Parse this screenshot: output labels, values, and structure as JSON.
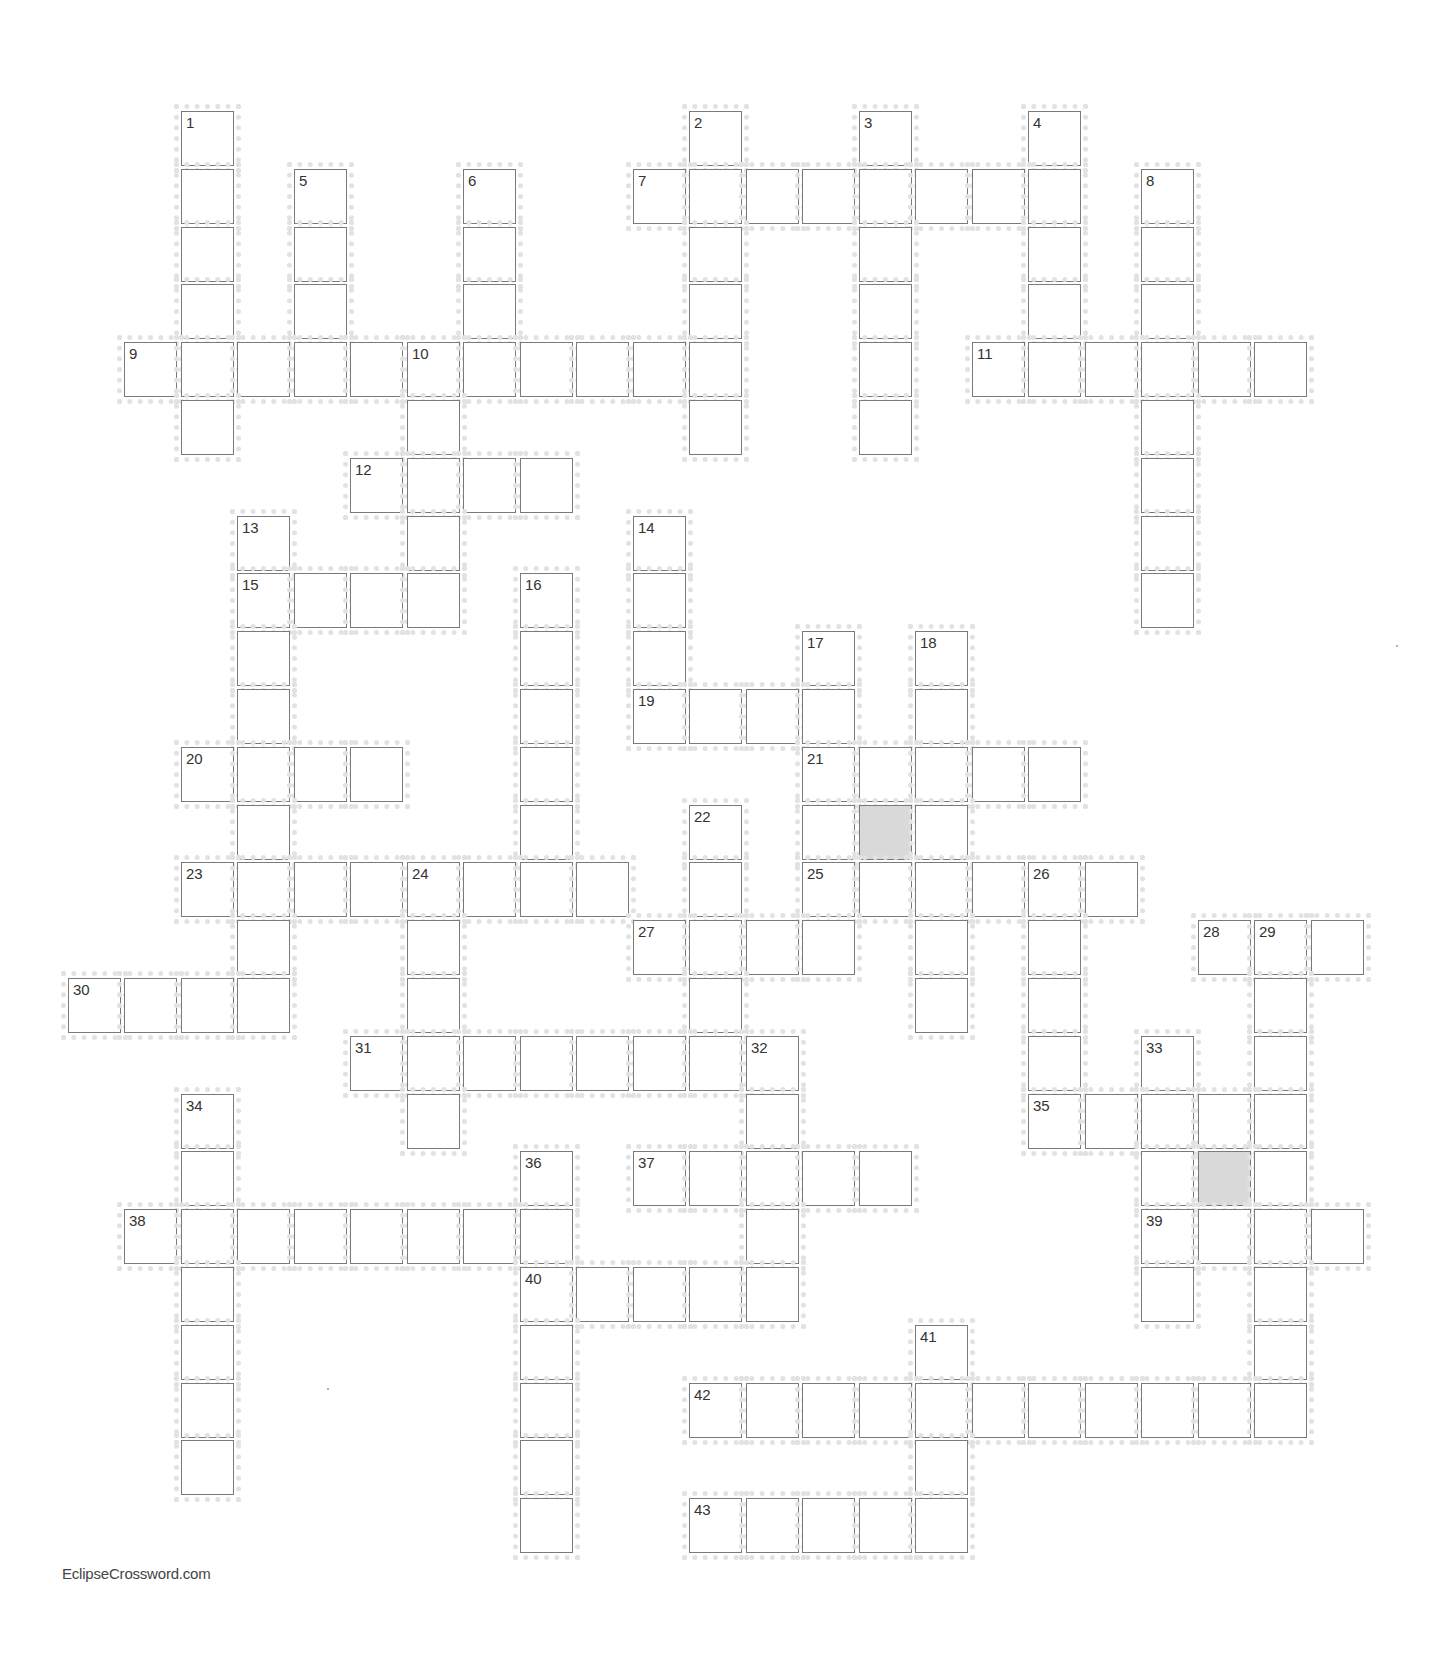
{
  "puzzle": {
    "type": "crossword",
    "grid": {
      "cols": 23,
      "rows": 25
    },
    "layout": {
      "origin_x": 67.5,
      "origin_y": 111,
      "pitch_x": 56.5,
      "pitch_y": 57.8
    },
    "colors": {
      "cell_border": "#7a7a7a",
      "shaded_cell": "#d9d9d9",
      "number_text": "#333333"
    },
    "rows": [
      {
        "r": 0,
        "cells": [
          [
            2,
            "1"
          ],
          [
            11,
            "2"
          ],
          [
            14,
            "3"
          ],
          [
            17,
            "4"
          ]
        ]
      },
      {
        "r": 1,
        "cells": [
          [
            2,
            ""
          ],
          [
            4,
            "5"
          ],
          [
            7,
            "6"
          ],
          [
            10,
            "7"
          ],
          [
            11,
            ""
          ],
          [
            12,
            ""
          ],
          [
            13,
            ""
          ],
          [
            14,
            ""
          ],
          [
            15,
            ""
          ],
          [
            16,
            ""
          ],
          [
            17,
            ""
          ],
          [
            19,
            "8"
          ]
        ]
      },
      {
        "r": 2,
        "cells": [
          [
            2,
            ""
          ],
          [
            4,
            ""
          ],
          [
            7,
            ""
          ],
          [
            11,
            ""
          ],
          [
            14,
            ""
          ],
          [
            17,
            ""
          ],
          [
            19,
            ""
          ]
        ]
      },
      {
        "r": 3,
        "cells": [
          [
            2,
            ""
          ],
          [
            4,
            ""
          ],
          [
            7,
            ""
          ],
          [
            11,
            ""
          ],
          [
            14,
            ""
          ],
          [
            17,
            ""
          ],
          [
            19,
            ""
          ]
        ]
      },
      {
        "r": 4,
        "cells": [
          [
            1,
            "9"
          ],
          [
            2,
            ""
          ],
          [
            3,
            ""
          ],
          [
            4,
            ""
          ],
          [
            5,
            ""
          ],
          [
            6,
            "10"
          ],
          [
            7,
            ""
          ],
          [
            8,
            ""
          ],
          [
            9,
            ""
          ],
          [
            10,
            ""
          ],
          [
            11,
            ""
          ],
          [
            14,
            ""
          ],
          [
            16,
            "11"
          ],
          [
            17,
            ""
          ],
          [
            18,
            ""
          ],
          [
            19,
            ""
          ],
          [
            20,
            ""
          ],
          [
            21,
            ""
          ]
        ]
      },
      {
        "r": 5,
        "cells": [
          [
            2,
            ""
          ],
          [
            6,
            ""
          ],
          [
            11,
            ""
          ],
          [
            14,
            ""
          ],
          [
            19,
            ""
          ]
        ]
      },
      {
        "r": 6,
        "cells": [
          [
            5,
            "12"
          ],
          [
            6,
            ""
          ],
          [
            7,
            ""
          ],
          [
            8,
            ""
          ],
          [
            19,
            ""
          ]
        ]
      },
      {
        "r": 7,
        "cells": [
          [
            3,
            "13"
          ],
          [
            6,
            ""
          ],
          [
            10,
            "14"
          ],
          [
            19,
            ""
          ]
        ]
      },
      {
        "r": 8,
        "cells": [
          [
            3,
            "15"
          ],
          [
            4,
            ""
          ],
          [
            5,
            ""
          ],
          [
            6,
            ""
          ],
          [
            8,
            "16"
          ],
          [
            10,
            ""
          ],
          [
            19,
            ""
          ]
        ]
      },
      {
        "r": 9,
        "cells": [
          [
            3,
            ""
          ],
          [
            8,
            ""
          ],
          [
            10,
            ""
          ],
          [
            13,
            "17"
          ],
          [
            15,
            "18"
          ]
        ]
      },
      {
        "r": 10,
        "cells": [
          [
            3,
            ""
          ],
          [
            8,
            ""
          ],
          [
            10,
            "19"
          ],
          [
            11,
            ""
          ],
          [
            12,
            ""
          ],
          [
            13,
            ""
          ],
          [
            15,
            ""
          ]
        ]
      },
      {
        "r": 11,
        "cells": [
          [
            2,
            "20"
          ],
          [
            3,
            ""
          ],
          [
            4,
            ""
          ],
          [
            5,
            ""
          ],
          [
            8,
            ""
          ],
          [
            13,
            "21"
          ],
          [
            14,
            ""
          ],
          [
            15,
            ""
          ],
          [
            16,
            ""
          ],
          [
            17,
            ""
          ]
        ]
      },
      {
        "r": 12,
        "cells": [
          [
            3,
            ""
          ],
          [
            8,
            ""
          ],
          [
            11,
            "22"
          ],
          [
            13,
            ""
          ],
          [
            14,
            "#"
          ],
          [
            15,
            ""
          ]
        ]
      },
      {
        "r": 13,
        "cells": [
          [
            2,
            "23"
          ],
          [
            3,
            ""
          ],
          [
            4,
            ""
          ],
          [
            5,
            ""
          ],
          [
            6,
            "24"
          ],
          [
            7,
            ""
          ],
          [
            8,
            ""
          ],
          [
            9,
            ""
          ],
          [
            11,
            ""
          ],
          [
            13,
            "25"
          ],
          [
            14,
            ""
          ],
          [
            15,
            ""
          ],
          [
            16,
            ""
          ],
          [
            17,
            "26"
          ],
          [
            18,
            ""
          ]
        ]
      },
      {
        "r": 14,
        "cells": [
          [
            3,
            ""
          ],
          [
            6,
            ""
          ],
          [
            10,
            "27"
          ],
          [
            11,
            ""
          ],
          [
            12,
            ""
          ],
          [
            13,
            ""
          ],
          [
            15,
            ""
          ],
          [
            17,
            ""
          ],
          [
            20,
            "28"
          ],
          [
            21,
            "29"
          ],
          [
            22,
            ""
          ]
        ]
      },
      {
        "r": 15,
        "cells": [
          [
            0,
            "30"
          ],
          [
            1,
            ""
          ],
          [
            2,
            ""
          ],
          [
            3,
            ""
          ],
          [
            6,
            ""
          ],
          [
            11,
            ""
          ],
          [
            15,
            ""
          ],
          [
            17,
            ""
          ],
          [
            21,
            ""
          ]
        ]
      },
      {
        "r": 16,
        "cells": [
          [
            5,
            "31"
          ],
          [
            6,
            ""
          ],
          [
            7,
            ""
          ],
          [
            8,
            ""
          ],
          [
            9,
            ""
          ],
          [
            10,
            ""
          ],
          [
            11,
            ""
          ],
          [
            12,
            "32"
          ],
          [
            17,
            ""
          ],
          [
            19,
            "33"
          ],
          [
            21,
            ""
          ]
        ]
      },
      {
        "r": 17,
        "cells": [
          [
            2,
            "34"
          ],
          [
            6,
            ""
          ],
          [
            12,
            ""
          ],
          [
            17,
            "35"
          ],
          [
            18,
            ""
          ],
          [
            19,
            ""
          ],
          [
            20,
            ""
          ],
          [
            21,
            ""
          ]
        ]
      },
      {
        "r": 18,
        "cells": [
          [
            2,
            ""
          ],
          [
            8,
            "36"
          ],
          [
            10,
            "37"
          ],
          [
            11,
            ""
          ],
          [
            12,
            ""
          ],
          [
            13,
            ""
          ],
          [
            14,
            ""
          ],
          [
            19,
            ""
          ],
          [
            20,
            "#"
          ],
          [
            21,
            ""
          ]
        ]
      },
      {
        "r": 19,
        "cells": [
          [
            1,
            "38"
          ],
          [
            2,
            ""
          ],
          [
            3,
            ""
          ],
          [
            4,
            ""
          ],
          [
            5,
            ""
          ],
          [
            6,
            ""
          ],
          [
            7,
            ""
          ],
          [
            8,
            ""
          ],
          [
            12,
            ""
          ],
          [
            19,
            "39"
          ],
          [
            20,
            ""
          ],
          [
            21,
            ""
          ],
          [
            22,
            ""
          ]
        ]
      },
      {
        "r": 20,
        "cells": [
          [
            2,
            ""
          ],
          [
            8,
            "40"
          ],
          [
            9,
            ""
          ],
          [
            10,
            ""
          ],
          [
            11,
            ""
          ],
          [
            12,
            ""
          ],
          [
            19,
            ""
          ],
          [
            21,
            ""
          ]
        ]
      },
      {
        "r": 21,
        "cells": [
          [
            2,
            ""
          ],
          [
            8,
            ""
          ],
          [
            15,
            "41"
          ],
          [
            21,
            ""
          ]
        ]
      },
      {
        "r": 22,
        "cells": [
          [
            2,
            ""
          ],
          [
            8,
            ""
          ],
          [
            11,
            "42"
          ],
          [
            12,
            ""
          ],
          [
            13,
            ""
          ],
          [
            14,
            ""
          ],
          [
            15,
            ""
          ],
          [
            16,
            ""
          ],
          [
            17,
            ""
          ],
          [
            18,
            ""
          ],
          [
            19,
            ""
          ],
          [
            20,
            ""
          ],
          [
            21,
            ""
          ]
        ]
      },
      {
        "r": 23,
        "cells": [
          [
            2,
            ""
          ],
          [
            8,
            ""
          ],
          [
            15,
            ""
          ]
        ]
      },
      {
        "r": 24,
        "cells": [
          [
            8,
            ""
          ],
          [
            11,
            "43"
          ],
          [
            12,
            ""
          ],
          [
            13,
            ""
          ],
          [
            14,
            ""
          ],
          [
            15,
            ""
          ]
        ]
      }
    ],
    "clue_numbers": [
      "1",
      "2",
      "3",
      "4",
      "5",
      "6",
      "7",
      "8",
      "9",
      "10",
      "11",
      "12",
      "13",
      "14",
      "15",
      "16",
      "17",
      "18",
      "19",
      "20",
      "21",
      "22",
      "23",
      "24",
      "25",
      "26",
      "27",
      "28",
      "29",
      "30",
      "31",
      "32",
      "33",
      "34",
      "35",
      "36",
      "37",
      "38",
      "39",
      "40",
      "41",
      "42",
      "43"
    ],
    "shaded_cells": [
      [
        12,
        14
      ],
      [
        18,
        20
      ]
    ]
  },
  "footer": {
    "credit": "EclipseCrossword.com"
  }
}
